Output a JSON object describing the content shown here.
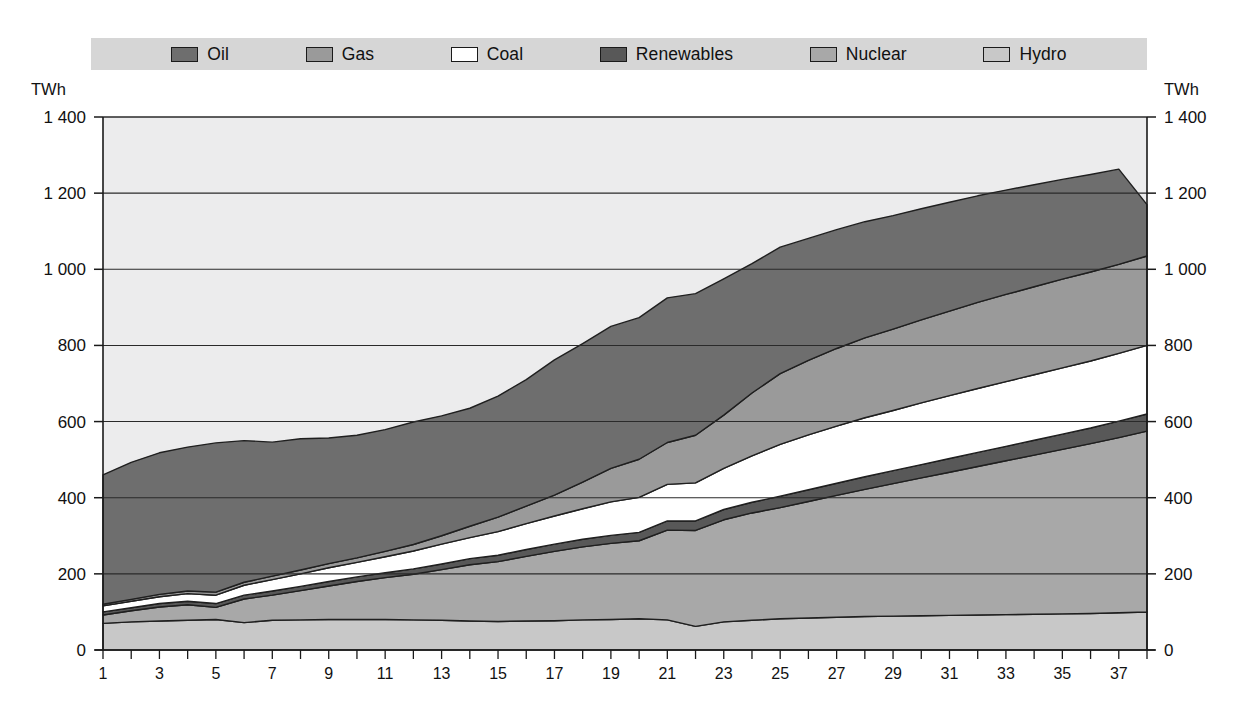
{
  "legend": {
    "items": [
      {
        "label": "Oil",
        "color": "#6e6e6e",
        "key": "oil"
      },
      {
        "label": "Gas",
        "color": "#9a9a9a",
        "key": "gas"
      },
      {
        "label": "Coal",
        "color": "#ffffff",
        "key": "coal"
      },
      {
        "label": "Renewables",
        "color": "#585858",
        "key": "renewables"
      },
      {
        "label": "Nuclear",
        "color": "#a8a8a8",
        "key": "nuclear"
      },
      {
        "label": "Hydro",
        "color": "#c8c8c8",
        "key": "hydro"
      }
    ],
    "background": "#d6d6d6"
  },
  "axis": {
    "unit_left": "TWh",
    "unit_right": "TWh",
    "y_ticks": [
      "0",
      "200",
      "400",
      "600",
      "800",
      "1 000",
      "1 200",
      "1 400"
    ],
    "y_values": [
      0,
      200,
      400,
      600,
      800,
      1000,
      1200,
      1400
    ],
    "x_labels": [
      "1",
      "3",
      "5",
      "7",
      "9",
      "11",
      "13",
      "15",
      "17",
      "19",
      "21",
      "23",
      "25",
      "27",
      "29",
      "31",
      "33",
      "35",
      "37"
    ],
    "x_label_values": [
      1,
      3,
      5,
      7,
      9,
      11,
      13,
      15,
      17,
      19,
      21,
      23,
      25,
      27,
      29,
      31,
      33,
      35,
      37
    ],
    "x_tick_values": [
      1,
      2,
      3,
      4,
      5,
      6,
      7,
      8,
      9,
      10,
      11,
      12,
      13,
      14,
      15,
      16,
      17,
      18,
      19,
      20,
      21,
      22,
      23,
      24,
      25,
      26,
      27,
      28,
      29,
      30,
      31,
      32,
      33,
      34,
      35,
      36,
      37,
      38
    ]
  },
  "chart_data": {
    "type": "area",
    "title": "",
    "xlabel": "",
    "ylabel": "TWh",
    "ylim": [
      0,
      1400
    ],
    "xlim": [
      1,
      38
    ],
    "grid": true,
    "stacked": true,
    "legend_position": "top",
    "stack_order_bottom_to_top": [
      "Hydro",
      "Nuclear",
      "Renewables",
      "Coal",
      "Gas",
      "Oil"
    ],
    "x": [
      1,
      2,
      3,
      4,
      5,
      6,
      7,
      8,
      9,
      10,
      11,
      12,
      13,
      14,
      15,
      16,
      17,
      18,
      19,
      20,
      21,
      22,
      23,
      24,
      25,
      26,
      27,
      28,
      29,
      30,
      31,
      32,
      33,
      34,
      35,
      36,
      37,
      38
    ],
    "series": [
      {
        "name": "Hydro",
        "color": "#c8c8c8",
        "values": [
          70,
          74,
          76,
          78,
          80,
          72,
          78,
          79,
          80,
          80,
          80,
          79,
          78,
          76,
          75,
          76,
          77,
          79,
          80,
          82,
          79,
          62,
          74,
          78,
          82,
          84,
          86,
          88,
          89,
          90,
          91,
          92,
          93,
          94,
          95,
          96,
          98,
          100
        ]
      },
      {
        "name": "Nuclear",
        "color": "#a8a8a8",
        "values": [
          22,
          29,
          37,
          41,
          32,
          62,
          66,
          77,
          88,
          100,
          110,
          120,
          133,
          148,
          157,
          170,
          182,
          192,
          200,
          205,
          236,
          252,
          268,
          282,
          292,
          306,
          320,
          334,
          348,
          362,
          376,
          390,
          404,
          418,
          432,
          446,
          460,
          475
        ]
      },
      {
        "name": "Renewables",
        "color": "#585858",
        "values": [
          8,
          8,
          9,
          9,
          10,
          10,
          11,
          11,
          12,
          12,
          13,
          14,
          15,
          16,
          17,
          18,
          19,
          20,
          21,
          22,
          24,
          25,
          27,
          28,
          30,
          31,
          32,
          33,
          34,
          35,
          36,
          37,
          38,
          39,
          40,
          41,
          43,
          45
        ]
      },
      {
        "name": "Coal",
        "color": "#ffffff",
        "values": [
          16,
          17,
          18,
          20,
          22,
          26,
          30,
          33,
          36,
          38,
          42,
          47,
          52,
          55,
          62,
          68,
          74,
          80,
          88,
          92,
          96,
          100,
          108,
          122,
          136,
          144,
          150,
          155,
          158,
          162,
          165,
          168,
          170,
          172,
          174,
          176,
          178,
          180
        ]
      },
      {
        "name": "Gas",
        "color": "#9a9a9a",
        "values": [
          4,
          5,
          6,
          7,
          8,
          8,
          9,
          10,
          11,
          12,
          14,
          17,
          22,
          30,
          38,
          46,
          55,
          70,
          88,
          100,
          110,
          125,
          140,
          165,
          186,
          196,
          204,
          210,
          214,
          218,
          222,
          226,
          229,
          231,
          233,
          234,
          234,
          235
        ]
      },
      {
        "name": "Oil",
        "color": "#6e6e6e",
        "values": [
          340,
          360,
          372,
          378,
          392,
          372,
          352,
          345,
          330,
          322,
          320,
          322,
          315,
          310,
          318,
          332,
          355,
          364,
          373,
          372,
          380,
          372,
          358,
          340,
          332,
          320,
          312,
          305,
          298,
          292,
          286,
          280,
          274,
          268,
          262,
          256,
          250,
          135
        ]
      }
    ],
    "totals": [
      460,
      493,
      518,
      533,
      544,
      550,
      546,
      555,
      557,
      564,
      579,
      599,
      615,
      635,
      667,
      710,
      762,
      805,
      850,
      873,
      925,
      936,
      975,
      1015,
      1058,
      1081,
      1104,
      1125,
      1141,
      1159,
      1176,
      1193,
      1208,
      1222,
      1236,
      1249,
      1263,
      1170
    ]
  }
}
